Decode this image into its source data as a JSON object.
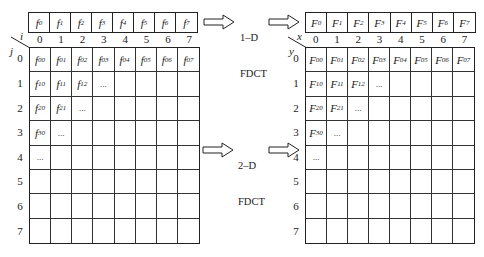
{
  "top": {
    "input_array": {
      "prefix": "f",
      "cells": [
        "0",
        "1",
        "2",
        "3",
        "4",
        "5",
        "6",
        "7"
      ]
    },
    "transform_label": [
      "1–D",
      "FDCT"
    ],
    "output_array": {
      "prefix": "F",
      "cells": [
        "0",
        "1",
        "2",
        "3",
        "4",
        "5",
        "6",
        "7"
      ]
    }
  },
  "bottom": {
    "input_grid": {
      "prefix": "f",
      "col_axis": "i",
      "row_axis": "j",
      "col_headers": [
        "0",
        "1",
        "2",
        "3",
        "4",
        "5",
        "6",
        "7"
      ],
      "row_headers": [
        "0",
        "1",
        "2",
        "3",
        "4",
        "5",
        "6",
        "7"
      ],
      "rows": [
        [
          "00",
          "01",
          "02",
          "03",
          "04",
          "05",
          "06",
          "07"
        ],
        [
          "10",
          "11",
          "12",
          "...",
          "",
          "",
          "",
          ""
        ],
        [
          "20",
          "21",
          "...",
          "",
          "",
          "",
          "",
          ""
        ],
        [
          "30",
          "...",
          "",
          "",
          "",
          "",
          "",
          ""
        ],
        [
          "...",
          "",
          "",
          "",
          "",
          "",
          "",
          ""
        ],
        [
          "",
          "",
          "",
          "",
          "",
          "",
          "",
          ""
        ],
        [
          "",
          "",
          "",
          "",
          "",
          "",
          "",
          ""
        ],
        [
          "",
          "",
          "",
          "",
          "",
          "",
          "",
          ""
        ]
      ]
    },
    "transform_label": [
      "2–D",
      "FDCT"
    ],
    "output_grid": {
      "prefix": "F",
      "col_axis": "x",
      "row_axis": "y",
      "col_headers": [
        "0",
        "1",
        "2",
        "3",
        "4",
        "5",
        "6",
        "7"
      ],
      "row_headers": [
        "0",
        "1",
        "2",
        "3",
        "4",
        "5",
        "6",
        "7"
      ],
      "rows": [
        [
          "00",
          "01",
          "02",
          "03",
          "04",
          "05",
          "06",
          "07"
        ],
        [
          "10",
          "11",
          "12",
          "...",
          "",
          "",
          "",
          ""
        ],
        [
          "20",
          "21",
          "...",
          "",
          "",
          "",
          "",
          ""
        ],
        [
          "30",
          "...",
          "",
          "",
          "",
          "",
          "",
          ""
        ],
        [
          "...",
          "",
          "",
          "",
          "",
          "",
          "",
          ""
        ],
        [
          "",
          "",
          "",
          "",
          "",
          "",
          "",
          ""
        ],
        [
          "",
          "",
          "",
          "",
          "",
          "",
          "",
          ""
        ],
        [
          "",
          "",
          "",
          "",
          "",
          "",
          "",
          ""
        ]
      ]
    }
  }
}
